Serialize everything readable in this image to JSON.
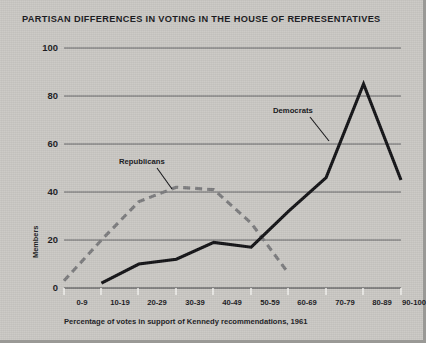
{
  "chart_title": "PARTISAN DIFFERENCES IN VOTING IN THE HOUSE OF REPRESENTATIVES",
  "colors": {
    "background": "#c9c7c3",
    "democrats": "#111114",
    "republicans": "#7b7b7d",
    "gridline": "#4a4a4c",
    "text": "#18181b"
  },
  "chart_data": {
    "type": "line",
    "title": "PARTISAN DIFFERENCES IN VOTING IN THE HOUSE OF REPRESENTATIVES",
    "xlabel": "Percentage of votes in support of Kennedy recommendations, 1961",
    "ylabel": "Members",
    "categories": [
      "0-9",
      "10-19",
      "20-29",
      "30-39",
      "40-49",
      "50-59",
      "60-69",
      "70-79",
      "80-89",
      "90-100"
    ],
    "ylim": [
      0,
      100
    ],
    "yticks": [
      0,
      20,
      40,
      60,
      80,
      100
    ],
    "grid": true,
    "legend": "inline-annotations",
    "series": [
      {
        "name": "Democrats",
        "style": "solid",
        "color": "#111114",
        "values": [
          null,
          2,
          10,
          12,
          19,
          17,
          32,
          46,
          85,
          45
        ]
      },
      {
        "name": "Republicans",
        "style": "dashed",
        "color": "#7b7b7d",
        "values": [
          3,
          20,
          36,
          42,
          41,
          27,
          6,
          null,
          null,
          null
        ]
      }
    ],
    "annotations": [
      {
        "text": "Republicans",
        "series": "Republicans"
      },
      {
        "text": "Democrats",
        "series": "Democrats"
      }
    ]
  }
}
